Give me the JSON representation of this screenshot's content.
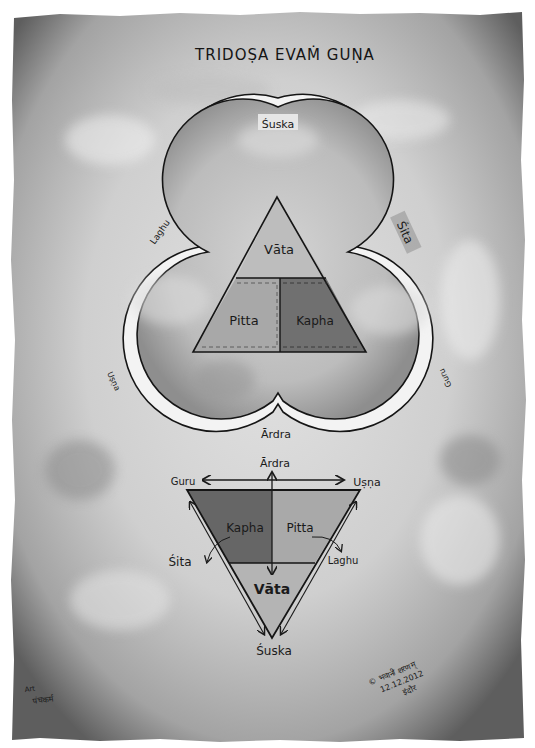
{
  "title": "TRIDOṢA EVAṀ GUṆA",
  "trefoil": {
    "labels": {
      "top": "Śuska",
      "upper_right": "Śita",
      "upper_left": "Laghu",
      "lower_left": "Uṣṇa",
      "lower_right": "Guru",
      "bottom": "Ārdra"
    }
  },
  "upper_triangle": {
    "sections": {
      "top": "Vāta",
      "bottom_left": "Pitta",
      "bottom_right": "Kapha"
    }
  },
  "lower_triangle": {
    "sections": {
      "top_left": "Kapha",
      "top_right": "Pitta",
      "bottom": "Vāta"
    },
    "axis_labels": {
      "top": "Ārdra",
      "left": "Guru",
      "right": "Uṣṇa",
      "bottom": "Śuska",
      "side_left": "Śita",
      "side_right": "Laghu"
    }
  },
  "signature": {
    "line1": "© भवानी शरणम्",
    "line2": "12.12.2012",
    "line3": "इंदौर"
  },
  "credit": {
    "line1": "Art",
    "line2": "पंचकर्म"
  },
  "colors": {
    "paper_light": "#dcdcdc",
    "paper_dark": "#6a6a6a",
    "vata": "#b9b9b9",
    "pitta": "#a6a6a6",
    "kapha": "#6f6f6f",
    "ink": "#151515"
  }
}
